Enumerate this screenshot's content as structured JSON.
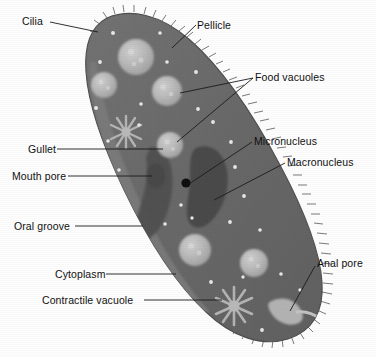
{
  "figure": {
    "type": "labeled-biological-diagram",
    "background_color": "#fdfdfd",
    "body_color": "#6a6a6a",
    "body_color_dark": "#5c5c5c",
    "oral_groove_color": "#757575",
    "nucleus_color": "#4a4a4a",
    "micronucleus_color": "#111111",
    "vacuole_color": "#b4b4b4",
    "cilia_color": "#6e6e6e",
    "leader_color": "#1a1a1a",
    "text_color": "#101010"
  },
  "labels": [
    {
      "id": "cilia",
      "text": "Cilia",
      "x": 22,
      "y": 16
    },
    {
      "id": "pellicle",
      "text": "Pellicle",
      "x": 197,
      "y": 20
    },
    {
      "id": "food-vacuoles",
      "text": "Food vacuoles",
      "x": 255,
      "y": 72
    },
    {
      "id": "gullet",
      "text": "Gullet",
      "x": 28,
      "y": 145
    },
    {
      "id": "micronucleus",
      "text": "Micronucleus",
      "x": 254,
      "y": 136
    },
    {
      "id": "macronucleus",
      "text": "Macronucleus",
      "x": 287,
      "y": 157
    },
    {
      "id": "mouth-pore",
      "text": "Mouth pore",
      "x": 12,
      "y": 172
    },
    {
      "id": "oral-groove",
      "text": "Oral groove",
      "x": 14,
      "y": 222
    },
    {
      "id": "cytoplasm",
      "text": "Cytoplasm",
      "x": 55,
      "y": 270
    },
    {
      "id": "anal-pore",
      "text": "Anal pore",
      "x": 317,
      "y": 258
    },
    {
      "id": "contractile-vacuole",
      "text": "Contractile vacuole",
      "x": 42,
      "y": 296
    }
  ],
  "structures": {
    "cell_body": {
      "name": "cell-body",
      "description": "elongated slipper-shaped paramecium body tilted from upper-left to lower-right"
    },
    "cilia_fringe": {
      "name": "cilia-fringe",
      "description": "fine hair-like projections around entire cell margin"
    },
    "pellicle": {
      "name": "pellicle",
      "description": "outer membrane boundary of the cell"
    },
    "oral_groove": {
      "name": "oral-groove",
      "description": "lighter diagonal channel along the left flank"
    },
    "gullet": {
      "name": "gullet",
      "description": "dark funnel-shaped channel below the mouth pore"
    },
    "mouth_pore": {
      "name": "mouth-pore",
      "description": "opening at the base of the oral groove"
    },
    "macronucleus": {
      "name": "macronucleus",
      "description": "large dark kidney-shaped nucleus near the cell center"
    },
    "micronucleus": {
      "name": "micronucleus",
      "description": "small black dot adjacent to the macronucleus"
    },
    "anal_pore": {
      "name": "anal-pore",
      "description": "small pale protrusion at the lower-right margin"
    },
    "food_vacuoles": {
      "name": "food-vacuole",
      "count": 6,
      "description": "pale rounded granular spheres scattered in cytoplasm"
    },
    "contractile_vacuoles": {
      "name": "contractile-vacuole",
      "count": 2,
      "description": "star-shaped radiating structures, one upper-left and one lower-right"
    },
    "cytoplasm_granules": {
      "name": "cytoplasm-granule",
      "count": 22,
      "description": "tiny white specks distributed through the cytoplasm"
    }
  }
}
